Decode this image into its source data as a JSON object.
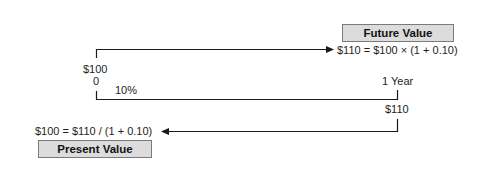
{
  "diagram": {
    "future_value": {
      "label": "Future Value",
      "formula": "$110 = $100 × (1 + 0.10)"
    },
    "present_value": {
      "label": "Present Value",
      "formula": "$100 = $110 / (1 + 0.10)"
    },
    "timeline": {
      "start_amount": "$100",
      "start_time": "0",
      "rate": "10%",
      "end_time": "1 Year",
      "end_amount": "$110"
    },
    "colors": {
      "line": "#1a1a1a",
      "box_fill": "#dcdcdc",
      "box_border": "#7a7a7a"
    }
  }
}
